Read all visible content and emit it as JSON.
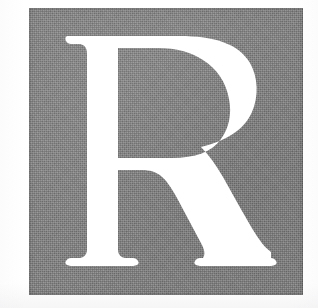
{
  "image": {
    "kind": "scanned-print-specimen",
    "canvas_width": 318,
    "canvas_height": 308,
    "page_background_color": "#FFFFFF",
    "description_label": "Large white serif capital letter R reversed out of a gray halftone square"
  },
  "block": {
    "name_label": "gray-halftone-square",
    "fill_color": "#828282",
    "x": 29,
    "y": 8,
    "width": 274,
    "height": 287,
    "texture": "halftone-dither"
  },
  "glyph": {
    "character": "R",
    "case_label": "uppercase",
    "color": "#FFFFFF",
    "style_label": "serif",
    "cap_height_px": 230,
    "baseline_y": 266,
    "cap_top_y": 36,
    "stem_left_x": 92,
    "stem_right_x": 118,
    "left_foot_span": "72-135",
    "leg_foot_span": "203-268",
    "bowl_right_x": 250
  }
}
